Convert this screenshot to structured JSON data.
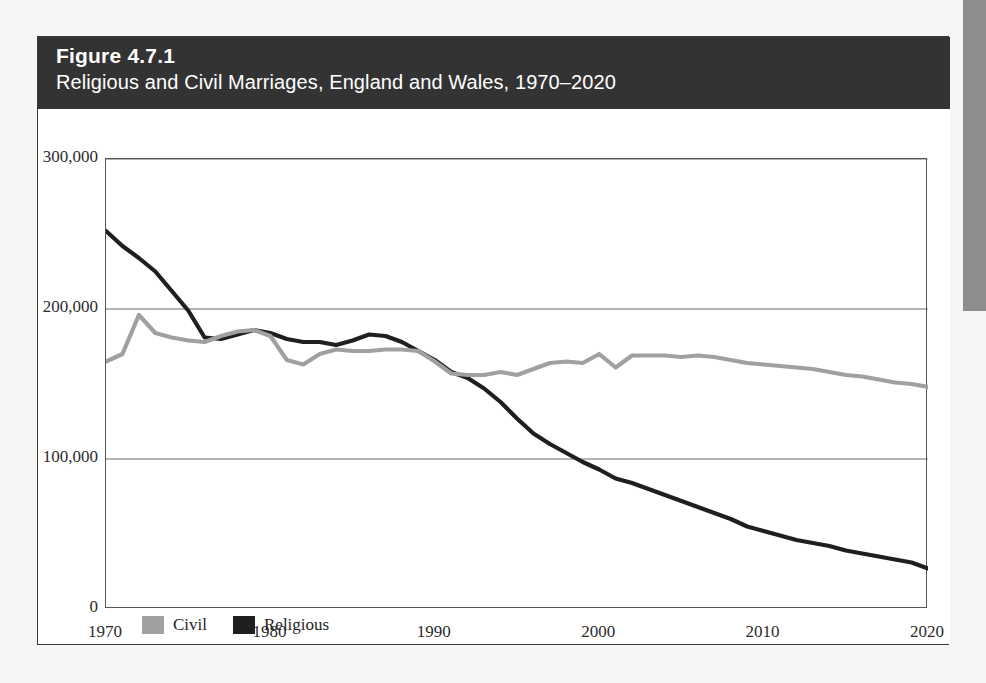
{
  "figure": {
    "number_label": "Figure 4.7.1",
    "subtitle": "Religious and Civil Marriages, England and Wales, 1970–2020",
    "header_bg": "#333333",
    "header_text_color": "#ffffff"
  },
  "legend": {
    "items": [
      {
        "label": "Civil",
        "color": "#a0a0a0"
      },
      {
        "label": "Religious",
        "color": "#1f1f1f"
      }
    ]
  },
  "axes": {
    "y_ticks": [
      "0",
      "100,000",
      "200,000",
      "300,000"
    ],
    "x_ticks": [
      "1970",
      "1980",
      "1990",
      "2000",
      "2010",
      "2020"
    ]
  },
  "chart_data": {
    "type": "line",
    "title": "Figure 4.7.1",
    "subtitle": "Religious and Civil Marriages, England and Wales, 1970–2020",
    "xlabel": "",
    "ylabel": "",
    "xlim": [
      1970,
      2020
    ],
    "ylim": [
      0,
      300000
    ],
    "y_ticks": [
      0,
      100000,
      200000,
      300000
    ],
    "x_ticks": [
      1970,
      1980,
      1990,
      2000,
      2010,
      2020
    ],
    "x_minor_tick_interval": 2,
    "grid": "horizontal",
    "legend_position": "below-axis-left",
    "x": [
      1970,
      1971,
      1972,
      1973,
      1974,
      1975,
      1976,
      1977,
      1978,
      1979,
      1980,
      1981,
      1982,
      1983,
      1984,
      1985,
      1986,
      1987,
      1988,
      1989,
      1990,
      1991,
      1992,
      1993,
      1994,
      1995,
      1996,
      1997,
      1998,
      1999,
      2000,
      2001,
      2002,
      2003,
      2004,
      2005,
      2006,
      2007,
      2008,
      2009,
      2010,
      2011,
      2012,
      2013,
      2014,
      2015,
      2016,
      2017,
      2018,
      2019,
      2020
    ],
    "series": [
      {
        "name": "Religious",
        "color": "#1f1f1f",
        "values": [
          252000,
          242000,
          234000,
          225000,
          212000,
          199000,
          181000,
          180000,
          183000,
          186000,
          184000,
          180000,
          178000,
          178000,
          176000,
          179000,
          183000,
          182000,
          178000,
          172000,
          166000,
          158000,
          154000,
          147000,
          138000,
          127000,
          117000,
          110000,
          104000,
          98000,
          93000,
          87000,
          84000,
          80000,
          76000,
          72000,
          68000,
          64000,
          60000,
          55000,
          52000,
          49000,
          46000,
          44000,
          42000,
          39000,
          37000,
          35000,
          33000,
          31000,
          27000
        ]
      },
      {
        "name": "Civil",
        "color": "#a0a0a0",
        "values": [
          165000,
          170000,
          196000,
          184000,
          181000,
          179000,
          178000,
          182000,
          185000,
          186000,
          182000,
          166000,
          163000,
          170000,
          173000,
          172000,
          172000,
          173000,
          173000,
          172000,
          165000,
          157000,
          156000,
          156000,
          158000,
          156000,
          160000,
          164000,
          165000,
          164000,
          170000,
          161000,
          169000,
          169000,
          169000,
          168000,
          169000,
          168000,
          166000,
          164000,
          163000,
          162000,
          161000,
          160000,
          158000,
          156000,
          155000,
          153000,
          151000,
          150000,
          148000
        ]
      }
    ]
  }
}
